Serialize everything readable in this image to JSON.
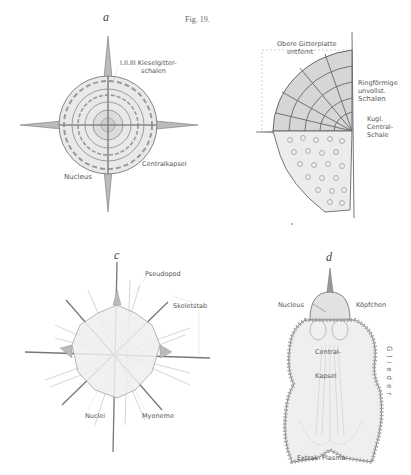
{
  "figure": {
    "title": "Fig. 19."
  },
  "panels": {
    "a": {
      "letter": "a",
      "labels": {
        "shells_1": "I.II.III Kieselgitter-",
        "shells_2": "schalen",
        "central_capsule": "Centralkapsel",
        "nucleus": "Nucleus"
      }
    },
    "b": {
      "letter": "",
      "labels": {
        "upper_1": "Obere Gitterplatte",
        "upper_2": "entfernt",
        "ring_1": "Ringförmige",
        "ring_2": "unvollst.",
        "ring_3": "Schalen",
        "kugl_1": "Kugl.",
        "kugl_2": "Central-",
        "kugl_3": "Schale"
      }
    },
    "c": {
      "letter": "c",
      "labels": {
        "pseudopod": "Pseudopod",
        "skeletal_rod": "Skeletstab",
        "nuclei": "Nuclei",
        "myoneme": "Myoneme"
      }
    },
    "d": {
      "letter": "d",
      "labels": {
        "nucleus": "Nucleus",
        "head": "Köpfchen",
        "central_1": "Central-",
        "central_2": "Kapsel",
        "segments": "Glieder",
        "extracap": "Extrak. Plasma"
      }
    }
  },
  "colors": {
    "ink": "#555555",
    "ink_light": "#9a9a9a",
    "fill": "#e6e6e6"
  }
}
